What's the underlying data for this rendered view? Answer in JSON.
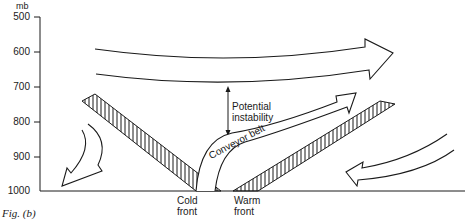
{
  "figure": {
    "caption": "Fig. (b)",
    "y_axis": {
      "unit": "mb",
      "ticks": [
        "500",
        "600",
        "700",
        "800",
        "900",
        "1000"
      ]
    },
    "labels": {
      "potential_instability_line1": "Potential",
      "potential_instability_line2": "instability",
      "conveyor_belt": "Conveyor belt",
      "cold_front_line1": "Cold",
      "cold_front_line2": "front",
      "warm_front_line1": "Warm",
      "warm_front_line2": "front"
    },
    "elements": [
      {
        "name": "upper-westerly-flow-arrow",
        "direction": "right"
      },
      {
        "name": "warm-conveyor-belt-arrow",
        "direction": "up-right"
      },
      {
        "name": "cold-frontal-zone",
        "style": "hatched"
      },
      {
        "name": "warm-frontal-zone",
        "style": "hatched"
      },
      {
        "name": "descending-cold-air-arrow-left",
        "direction": "down-left"
      },
      {
        "name": "low-level-inflow-arrow-right",
        "direction": "left"
      }
    ],
    "colors": {
      "ink": "#1a1a1a",
      "background": "#ffffff"
    }
  }
}
